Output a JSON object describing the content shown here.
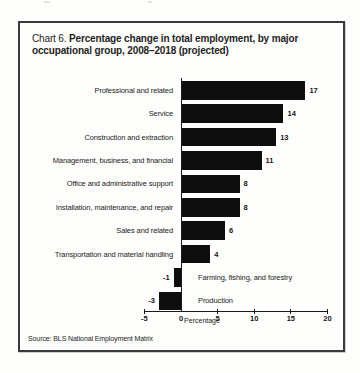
{
  "title": {
    "prefix": "Chart 6.",
    "line1": "Percentage change in total employment, by major",
    "line2": "occupational group, 2008–2018 (projected)"
  },
  "source_note": "Source: BLS National Employment Matrix",
  "chart_data": {
    "type": "bar",
    "orientation": "horizontal",
    "title": "Chart 6. Percentage change in total employment, by major occupational group, 2008–2018 (projected)",
    "categories": [
      "Professional and related",
      "Service",
      "Construction and extraction",
      "Management, business, and financial",
      "Office and administrative support",
      "Installation, maintenance, and repair",
      "Sales and related",
      "Transportation and material handling",
      "Farming, fishing, and forestry",
      "Production"
    ],
    "values": [
      17,
      14,
      13,
      11,
      8,
      8,
      6,
      4,
      -1,
      -3
    ],
    "xlabel": "Percentage",
    "x_ticks": [
      -5,
      0,
      5,
      10,
      15,
      20
    ],
    "xlim": [
      -5,
      20
    ],
    "grid": false,
    "legend": "none",
    "bar_color": "#0d0d0d",
    "background_color": "#fdfdfb",
    "frame_color": "#3a3a3a"
  }
}
